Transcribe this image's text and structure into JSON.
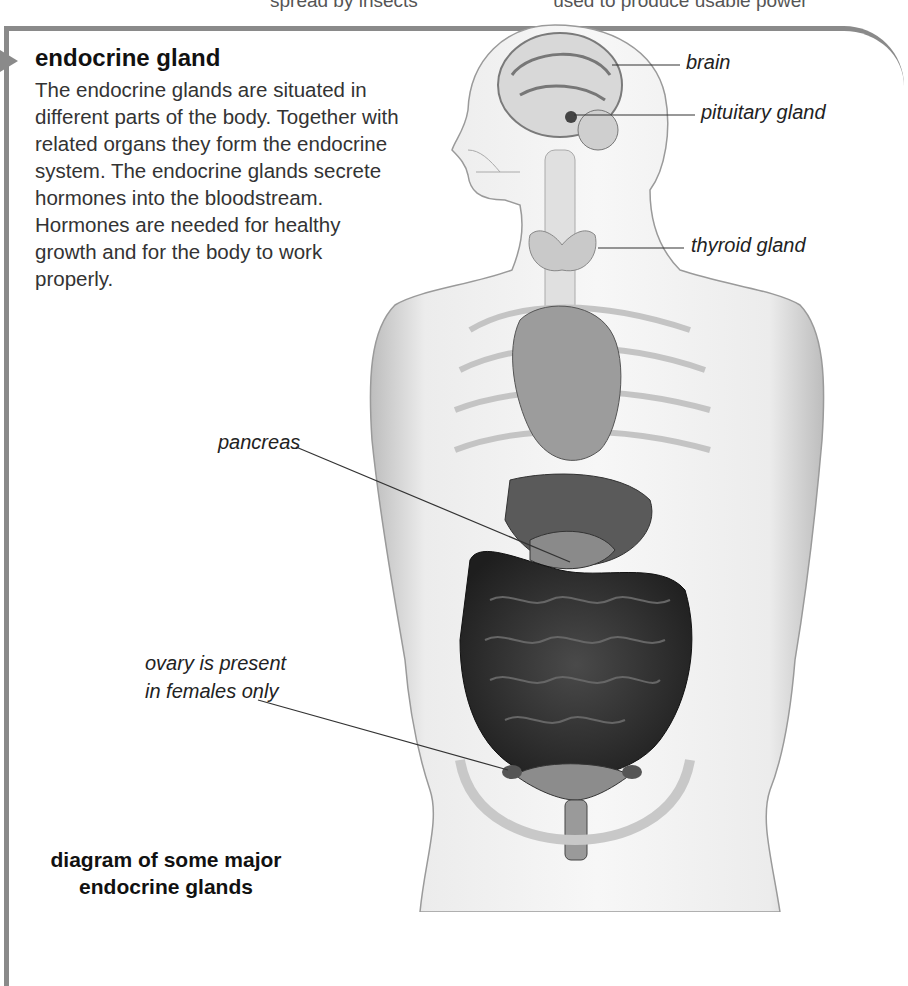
{
  "top_fragment": {
    "left": "spread by insects",
    "right": "used to produce usable power"
  },
  "entry": {
    "heading": "endocrine gland",
    "description": "The endocrine glands are situated in different parts of the body. Together with related organs they form the endocrine system. The endocrine glands secrete hormones into the bloodstream. Hormones are needed for healthy growth and for the body to work properly."
  },
  "diagram": {
    "caption_line1": "diagram of some major",
    "caption_line2": "endocrine glands",
    "labels": {
      "brain": "brain",
      "pituitary": "pituitary gland",
      "thyroid": "thyroid gland",
      "pancreas": "pancreas",
      "ovary_line1": "ovary is present",
      "ovary_line2": "in females only"
    }
  },
  "colors": {
    "frame": "#8a8a8a",
    "text": "#1a1a1a"
  }
}
